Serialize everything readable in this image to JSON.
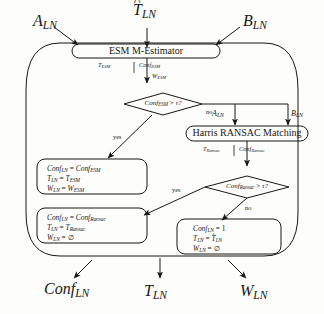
{
  "diagram": {
    "type": "flowchart",
    "title_visible": false,
    "inputs": {
      "left": "A",
      "left_sub": "LN",
      "top": "T",
      "top_sub": "LN",
      "top_accent": "^",
      "right": "B",
      "right_sub": "LN"
    },
    "process_nodes": [
      {
        "id": "esm",
        "label": "ESM M-Estimator"
      },
      {
        "id": "ransac",
        "label": "Harris RANSAC Matching"
      }
    ],
    "decision_nodes": [
      {
        "id": "dec1",
        "lhs": "Conf",
        "lhs_sub": "ESM",
        "op": ">",
        "rhs": "τ?"
      },
      {
        "id": "dec2",
        "lhs": "Conf",
        "lhs_sub": "Ransac",
        "op": ">",
        "rhs": "τ?"
      }
    ],
    "flow_labels": [
      {
        "id": "esm_t",
        "base": "T",
        "sub": "ESM"
      },
      {
        "id": "esm_conf",
        "base": "Conf",
        "sub": "ESM"
      },
      {
        "id": "esm_w",
        "base": "W",
        "sub": "ESM"
      },
      {
        "id": "rans_t",
        "base": "T",
        "sub": "Ransac"
      },
      {
        "id": "rans_conf",
        "base": "Conf",
        "sub": "Ransac"
      },
      {
        "id": "mid_a",
        "base": "A",
        "sub": "LN"
      },
      {
        "id": "mid_b",
        "base": "B",
        "sub": "LN"
      }
    ],
    "branch_labels": [
      {
        "id": "dec1_no",
        "text": "no"
      },
      {
        "id": "dec1_yes",
        "text": "yes"
      },
      {
        "id": "dec2_yes",
        "text": "yes"
      },
      {
        "id": "dec2_no",
        "text": "no"
      }
    ],
    "assignment_boxes": [
      {
        "id": "assign_esm",
        "lines": [
          {
            "lhs": "Conf",
            "lhs_sub": "LN",
            "rhs": "Conf",
            "rhs_sub": "ESM"
          },
          {
            "lhs": "T",
            "lhs_sub": "LN",
            "rhs": "T",
            "rhs_sub": "ESM"
          },
          {
            "lhs": "W",
            "lhs_sub": "LN",
            "rhs": "W",
            "rhs_sub": "ESM"
          }
        ]
      },
      {
        "id": "assign_ransac",
        "lines": [
          {
            "lhs": "Conf",
            "lhs_sub": "LN",
            "rhs": "Conf",
            "rhs_sub": "Ransac"
          },
          {
            "lhs": "T",
            "lhs_sub": "LN",
            "rhs": "T",
            "rhs_sub": "Ransac"
          },
          {
            "lhs": "W",
            "lhs_sub": "LN",
            "rhs": "∅",
            "rhs_sub": ""
          }
        ]
      },
      {
        "id": "assign_fail",
        "lines": [
          {
            "lhs": "Conf",
            "lhs_sub": "LN",
            "rhs": "1",
            "rhs_sub": ""
          },
          {
            "lhs": "T",
            "lhs_sub": "LN",
            "rhs": "T",
            "rhs_sub": "LN",
            "rhs_accent": "^"
          },
          {
            "lhs": "W",
            "lhs_sub": "LN",
            "rhs": "∅",
            "rhs_sub": ""
          }
        ]
      }
    ],
    "outputs": [
      {
        "id": "out_conf",
        "base": "Conf",
        "sub": "LN"
      },
      {
        "id": "out_t",
        "base": "T",
        "sub": "LN"
      },
      {
        "id": "out_w",
        "base": "W",
        "sub": "LN"
      }
    ],
    "colors": {
      "ink": "#171717",
      "background": "#fdfdfb"
    }
  }
}
